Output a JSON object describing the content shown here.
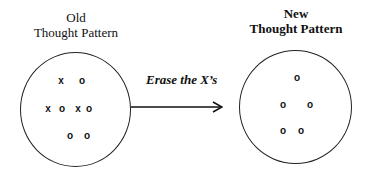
{
  "old_pattern": {
    "title_line1": "Old",
    "title_line2": "Thought Pattern",
    "marks": [
      {
        "symbol": "x",
        "x": 61,
        "y": 81
      },
      {
        "symbol": "o",
        "x": 82,
        "y": 81
      },
      {
        "symbol": "x",
        "x": 48,
        "y": 109
      },
      {
        "symbol": "o",
        "x": 62,
        "y": 109
      },
      {
        "symbol": "x",
        "x": 78,
        "y": 109
      },
      {
        "symbol": "o",
        "x": 89,
        "y": 109
      },
      {
        "symbol": "o",
        "x": 70,
        "y": 136
      },
      {
        "symbol": "o",
        "x": 87,
        "y": 136
      }
    ]
  },
  "transition": {
    "label": "Erase the X’s"
  },
  "new_pattern": {
    "title_line1": "New",
    "title_line2": "Thought Pattern",
    "marks": [
      {
        "symbol": "o",
        "x": 297,
        "y": 78
      },
      {
        "symbol": "o",
        "x": 283,
        "y": 105
      },
      {
        "symbol": "o",
        "x": 310,
        "y": 105
      },
      {
        "symbol": "o",
        "x": 283,
        "y": 131
      },
      {
        "symbol": "o",
        "x": 301,
        "y": 131
      }
    ]
  }
}
